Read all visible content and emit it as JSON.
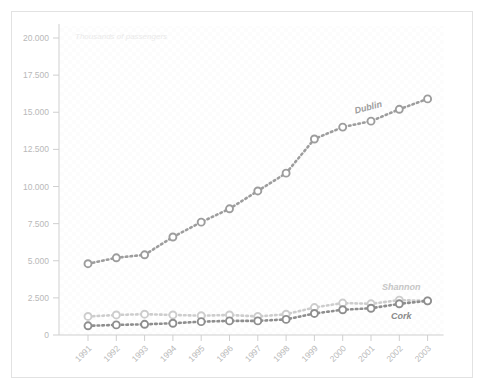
{
  "chart_data": {
    "type": "line",
    "title": "",
    "subtitle": "Thousands of passengers",
    "xlabel": "",
    "ylabel": "",
    "categories": [
      "1991",
      "1992",
      "1993",
      "1994",
      "1995",
      "1996",
      "1997",
      "1998",
      "1999",
      "2000",
      "2001",
      "2002",
      "2003"
    ],
    "x_tick_labels": [
      "1991",
      "1992",
      "1993",
      "1994",
      "1995",
      "1996",
      "1997",
      "1998",
      "1999",
      "2000",
      "2001",
      "2002",
      "2003"
    ],
    "y_tick_labels": [
      "0",
      "2.500",
      "5.000",
      "7.500",
      "10.000",
      "12.500",
      "15.000",
      "17.500",
      "20.000"
    ],
    "y_tick_values": [
      0,
      2500,
      5000,
      7500,
      10000,
      12500,
      15000,
      17500,
      20000
    ],
    "ylim": [
      0,
      20000
    ],
    "grid": false,
    "legend_position": "inline-annotations",
    "series": [
      {
        "name": "Dublin",
        "color": "#9d9d9d",
        "label_color": "#9d9d9d",
        "values": [
          4800,
          5200,
          5400,
          6600,
          7600,
          8500,
          9700,
          10900,
          13200,
          14000,
          14400,
          15200,
          15900
        ]
      },
      {
        "name": "Shannon",
        "color": "#cdcdcd",
        "label_color": "#c6c6c6",
        "values": [
          1250,
          1350,
          1400,
          1350,
          1300,
          1350,
          1250,
          1400,
          1850,
          2150,
          2100,
          2350,
          2300
        ]
      },
      {
        "name": "Cork",
        "color": "#8e8e8e",
        "label_color": "#8a8a8a",
        "values": [
          620,
          680,
          720,
          790,
          900,
          950,
          950,
          1050,
          1450,
          1700,
          1800,
          2100,
          2300
        ]
      }
    ],
    "annotations": [
      {
        "text": "Dublin",
        "series": "Dublin",
        "at_category": "2001"
      },
      {
        "text": "Shannon",
        "series": "Shannon",
        "at_category": "2002"
      },
      {
        "text": "Cork",
        "series": "Cork",
        "at_category": "2002"
      }
    ],
    "axis_color": "#cfcfcf",
    "background_color": "#ffffff",
    "frame_color": "#e2e2e2"
  }
}
